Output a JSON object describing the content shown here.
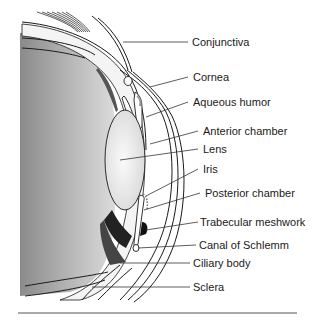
{
  "diagram": {
    "labels": [
      {
        "id": "conjunctiva",
        "text": "Conjunctiva",
        "x": 192,
        "y": 35
      },
      {
        "id": "cornea",
        "text": "Cornea",
        "x": 193,
        "y": 72
      },
      {
        "id": "aqueous-humor",
        "text": "Aqueous humor",
        "x": 193,
        "y": 96
      },
      {
        "id": "anterior-chamber",
        "text": "Anterior chamber",
        "x": 203,
        "y": 126
      },
      {
        "id": "lens",
        "text": "Lens",
        "x": 203,
        "y": 143
      },
      {
        "id": "iris",
        "text": "Iris",
        "x": 203,
        "y": 164
      },
      {
        "id": "posterior-chamber",
        "text": "Posterior chamber",
        "x": 205,
        "y": 188
      },
      {
        "id": "trabecular-meshwork",
        "text": "Trabecular meshwork",
        "x": 200,
        "y": 217
      },
      {
        "id": "canal-of-schlemm",
        "text": "Canal of Schlemm",
        "x": 199,
        "y": 239
      },
      {
        "id": "ciliary-body",
        "text": "Ciliary body",
        "x": 193,
        "y": 258
      },
      {
        "id": "sclera",
        "text": "Sclera",
        "x": 193,
        "y": 282
      }
    ],
    "colors": {
      "line": "#1a1a1a",
      "vitreous_dark": "#8c8c8c",
      "vitreous_light": "#d9d9d9",
      "lens": "#eeeeee",
      "tissue": "#f2f2f2"
    }
  }
}
